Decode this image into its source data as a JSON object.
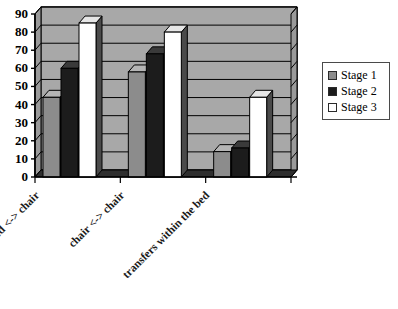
{
  "chart_data": {
    "type": "bar",
    "title": "",
    "subtitle": "",
    "xlabel": "",
    "ylabel": "",
    "categories": [
      "bed <-> chair",
      "chair <-> chair",
      "transfers within the bed"
    ],
    "series": [
      {
        "name": "Stage 1",
        "color": "#8c8c8c",
        "values": [
          44,
          58,
          14
        ]
      },
      {
        "name": "Stage 2",
        "color": "#1c1c1c",
        "values": [
          60,
          68,
          16
        ]
      },
      {
        "name": "Stage 3",
        "color": "#ffffff",
        "values": [
          85,
          80,
          44
        ]
      }
    ],
    "ylim": [
      0,
      90
    ],
    "yticks": [
      0,
      10,
      20,
      30,
      40,
      50,
      60,
      70,
      80,
      90
    ],
    "ytick_labels": [
      "0",
      "10",
      "20",
      "30",
      "40",
      "50",
      "60",
      "70",
      "80",
      "90"
    ],
    "grid": true,
    "grid_axis": "y",
    "legend_position": "right",
    "style": "3d-column",
    "plot_background": "#a8a8a8",
    "grid_color": "#000000",
    "axis_color": "#000000"
  },
  "legend": {
    "items": [
      {
        "label": "Stage 1",
        "color": "#8c8c8c"
      },
      {
        "label": "Stage 2",
        "color": "#1c1c1c"
      },
      {
        "label": "Stage 3",
        "color": "#ffffff"
      }
    ]
  }
}
